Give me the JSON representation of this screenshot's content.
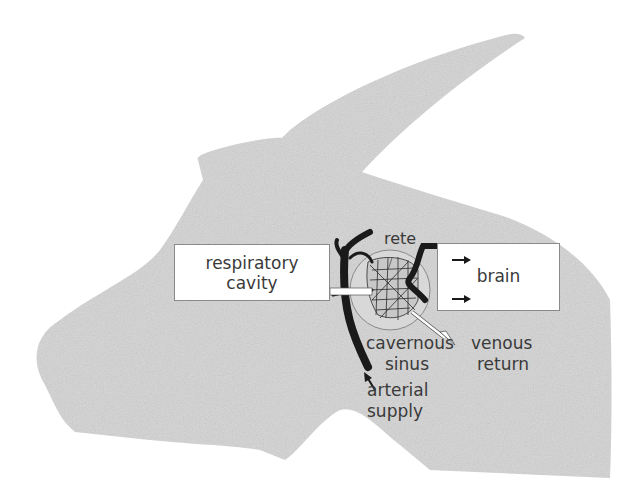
{
  "diagram": {
    "colors": {
      "silhouette": "#d4d4d4",
      "box_fill": "#ffffff",
      "box_border": "#8a8a8a",
      "text": "#3a3a3a",
      "vessels": "#1a1a1a"
    },
    "boxes": {
      "respiratory": {
        "line1": "respiratory",
        "line2": "cavity"
      },
      "brain": {
        "label": "brain"
      }
    },
    "labels": {
      "rete": "rete",
      "cavernous_1": "cavernous",
      "cavernous_2": "sinus",
      "venous_1": "venous",
      "venous_2": "return",
      "arterial_1": "arterial",
      "arterial_2": "supply"
    },
    "arrows": [
      {
        "from": "respiratory cavity",
        "to": "cavernous sinus",
        "style": "hollow"
      },
      {
        "from": "cavernous sinus",
        "to": "venous return",
        "style": "hollow"
      },
      {
        "from": "arterial supply",
        "to": "rete",
        "style": "solid"
      },
      {
        "from": "rete",
        "to": "brain",
        "style": "solid",
        "count": 2
      }
    ]
  }
}
